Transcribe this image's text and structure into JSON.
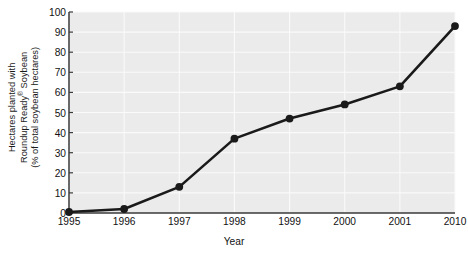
{
  "chart_data": {
    "type": "line",
    "title": "",
    "subtitle": "",
    "xlabel": "Year",
    "ylabel": "Hectares planted with Roundup Ready® Soybean (% of total soybean hectares)",
    "ylabel_lines": [
      "Hectares planted with",
      "Roundup Ready® Soybean",
      "(% of total soybean hectares)"
    ],
    "categories": [
      "1995",
      "1996",
      "1997",
      "1998",
      "1999",
      "2000",
      "2001",
      "2010"
    ],
    "values": [
      0.5,
      2,
      13,
      37,
      47,
      54,
      63,
      93
    ],
    "series": [
      {
        "name": "Roundup Ready Soybean adoption",
        "values": [
          0.5,
          2,
          13,
          37,
          47,
          54,
          63,
          93
        ]
      }
    ],
    "yticks": [
      0,
      10,
      20,
      30,
      40,
      50,
      60,
      70,
      80,
      90,
      100
    ],
    "ytick_labels": [
      "0",
      "10",
      "20",
      "30",
      "40",
      "50",
      "60",
      "70",
      "80",
      "90",
      "100"
    ],
    "xtick_labels": [
      "1995",
      "1996",
      "1997",
      "1998",
      "1999",
      "2000",
      "2001",
      "2010"
    ],
    "ylim": [
      0,
      100
    ],
    "grid": true,
    "legend": false,
    "legend_position": "none",
    "line_color": "#1a1a1a",
    "marker_color": "#1a1a1a",
    "marker": "circle",
    "plot_background": "#ebebeb",
    "grid_color": "#fafafa",
    "axis_color": "#3a3a3a"
  }
}
